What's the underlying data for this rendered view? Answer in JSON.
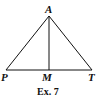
{
  "figure": {
    "caption": "Ex. 7",
    "points": {
      "A": {
        "label": "A"
      },
      "P": {
        "label": "P"
      },
      "M": {
        "label": "M"
      },
      "T": {
        "label": "T"
      }
    },
    "segments": [
      "AP",
      "AT",
      "PT",
      "AM"
    ],
    "line_color": "#111111"
  }
}
